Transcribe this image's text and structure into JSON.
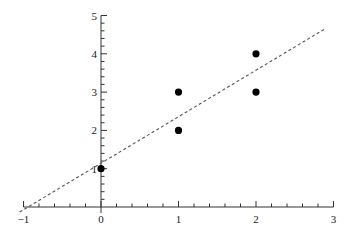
{
  "chart_data": {
    "type": "scatter",
    "title": "",
    "xlabel": "",
    "ylabel": "",
    "xlim": [
      -1,
      3
    ],
    "ylim": [
      0,
      5
    ],
    "grid": false,
    "legend": null,
    "x_ticks": [
      "-1",
      "0",
      "1",
      "2",
      "3"
    ],
    "y_ticks": [
      "1",
      "2",
      "3",
      "4",
      "5"
    ],
    "series": [
      {
        "name": "points",
        "kind": "scatter",
        "points": [
          [
            0,
            1
          ],
          [
            1,
            2
          ],
          [
            1,
            3
          ],
          [
            2,
            3
          ],
          [
            2,
            4
          ]
        ]
      },
      {
        "name": "regression line",
        "kind": "line",
        "style": "dashed",
        "slope": 1.214,
        "intercept": 1.143,
        "x_range": [
          -1.05,
          2.9
        ]
      }
    ]
  },
  "colors": {
    "axis": "#333333",
    "points": "#000000",
    "line": "#555555"
  }
}
